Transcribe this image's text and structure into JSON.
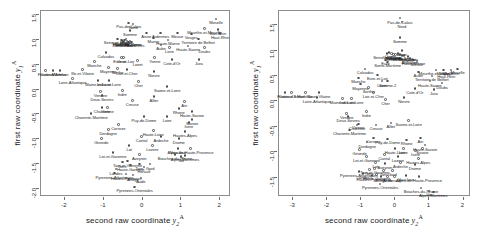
{
  "figure": {
    "type": "scatter-pair",
    "background": "#ffffff",
    "marker_color": "#4d4d4d",
    "axis_color": "#6e6e6e",
    "label_color": "#1f1f1f"
  },
  "chart_data": [
    {
      "type": "scatter",
      "panel": "left",
      "title": "",
      "xlabel": "second raw coordinate",
      "xlabel_var": "y",
      "xlabel_sub": "2",
      "xlabel_sup": "A",
      "ylabel": "first raw coordinate",
      "ylabel_var": "y",
      "ylabel_sub": "1",
      "ylabel_sup": "A",
      "xlim": [
        -2.62,
        2.28
      ],
      "ylim": [
        -2.16,
        1.58
      ],
      "xticks": [
        -2,
        -1,
        0,
        1,
        2
      ],
      "xticklabels": [
        "-2",
        "-1",
        "0",
        "1",
        "2"
      ],
      "yticks": [
        1.5,
        1.0,
        0.5,
        0.0,
        -0.5,
        -1.0,
        -1.5,
        -2.0
      ],
      "yticklabels": [
        "1.5",
        "1.0",
        "0.5",
        "0.0",
        "-0.5",
        "-1.0",
        "-1.5",
        "-2.0"
      ],
      "grid": false,
      "legend": "none",
      "points": [
        {
          "label": "Pas-de-Calais",
          "x": -0.33,
          "y": 1.32
        },
        {
          "label": "Nord",
          "x": -0.22,
          "y": 1.3
        },
        {
          "label": "Moselle",
          "x": 1.92,
          "y": 1.4
        },
        {
          "label": "Meurthe-et-Moselle",
          "x": 1.62,
          "y": 1.21
        },
        {
          "label": "Bas-Rhin",
          "x": 1.97,
          "y": 1.19
        },
        {
          "label": "Haut-Rhin",
          "x": 2.02,
          "y": 1.11
        },
        {
          "label": "Somme",
          "x": -0.3,
          "y": 1.17
        },
        {
          "label": "Aisne",
          "x": 0.12,
          "y": 1.12
        },
        {
          "label": "Ardennes",
          "x": 0.49,
          "y": 1.12
        },
        {
          "label": "Meuse",
          "x": 0.92,
          "y": 1.12
        },
        {
          "label": "Vosges",
          "x": 1.28,
          "y": 1.1
        },
        {
          "label": "Marne",
          "x": 0.3,
          "y": 1.02
        },
        {
          "label": "Haute-Marne",
          "x": 0.68,
          "y": 0.98
        },
        {
          "label": "Territoire de Belfort",
          "x": 1.46,
          "y": 1.0
        },
        {
          "label": "Seine-et-Marne",
          "x": -0.62,
          "y": 1.0
        },
        {
          "label": "Oise",
          "x": -0.4,
          "y": 1.0
        },
        {
          "label": "Val-d'Oise",
          "x": -0.52,
          "y": 0.98
        },
        {
          "label": "Yvelines",
          "x": -0.5,
          "y": 0.96
        },
        {
          "label": "Essonne",
          "x": -0.46,
          "y": 0.94
        },
        {
          "label": "Paris",
          "x": -0.44,
          "y": 0.98
        },
        {
          "label": "Hauts-de-Seine",
          "x": -0.38,
          "y": 0.96
        },
        {
          "label": "Seine-Saint-Denis",
          "x": -0.34,
          "y": 0.94
        },
        {
          "label": "Val-de-Marne",
          "x": -0.3,
          "y": 0.96
        },
        {
          "label": "Eure",
          "x": -0.26,
          "y": 0.94
        },
        {
          "label": "Aube",
          "x": 0.5,
          "y": 0.88
        },
        {
          "label": "Haute-Saone",
          "x": 1.2,
          "y": 0.86
        },
        {
          "label": "Doubs",
          "x": 1.62,
          "y": 0.82
        },
        {
          "label": "Jura",
          "x": 1.48,
          "y": 0.58
        },
        {
          "label": "Loire",
          "x": 0.72,
          "y": 0.82
        },
        {
          "label": "Calvados",
          "x": -0.92,
          "y": 0.72
        },
        {
          "label": "Orne",
          "x": -0.52,
          "y": 0.62
        },
        {
          "label": "Eure-et-Loir",
          "x": -0.46,
          "y": 0.62
        },
        {
          "label": "Yonne",
          "x": 0.34,
          "y": 0.62
        },
        {
          "label": "Cote-d'Or",
          "x": 0.78,
          "y": 0.58
        },
        {
          "label": "Manche",
          "x": -1.22,
          "y": 0.54
        },
        {
          "label": "Loiret",
          "x": -0.1,
          "y": 0.56
        },
        {
          "label": "Mayenne",
          "x": -0.86,
          "y": 0.42
        },
        {
          "label": "Sarthe",
          "x": -0.62,
          "y": 0.4
        },
        {
          "label": "Loir-et-Cher",
          "x": -0.38,
          "y": 0.38
        },
        {
          "label": "Nievre",
          "x": 0.32,
          "y": 0.34
        },
        {
          "label": "Ille-et-Vilaine",
          "x": -1.52,
          "y": 0.38
        },
        {
          "label": "Cotes-d'Armor",
          "x": -2.28,
          "y": 0.36
        },
        {
          "label": "Finistere",
          "x": -2.48,
          "y": 0.36
        },
        {
          "label": "Morbihan",
          "x": -2.1,
          "y": 0.36
        },
        {
          "label": "Loire-Atlantique",
          "x": -1.78,
          "y": 0.2
        },
        {
          "label": "Maine-et-Loire",
          "x": -1.12,
          "y": 0.16
        },
        {
          "label": "Indre-et-Loire",
          "x": -0.84,
          "y": 0.16
        },
        {
          "label": "Cher",
          "x": -0.08,
          "y": 0.14
        },
        {
          "label": "Saone-et-Loire",
          "x": 0.66,
          "y": 0.04
        },
        {
          "label": "Vendee",
          "x": -1.06,
          "y": -0.06
        },
        {
          "label": "Indre",
          "x": -0.5,
          "y": -0.04
        },
        {
          "label": "Deux-Sevres",
          "x": -1.02,
          "y": -0.14
        },
        {
          "label": "Allier",
          "x": 0.32,
          "y": -0.16
        },
        {
          "label": "Creuse",
          "x": -0.24,
          "y": -0.24
        },
        {
          "label": "Ain",
          "x": 1.1,
          "y": -0.26
        },
        {
          "label": "Vienne",
          "x": -0.88,
          "y": -0.38
        },
        {
          "label": "Charente",
          "x": -1.02,
          "y": -0.38
        },
        {
          "label": "Rhone",
          "x": 0.96,
          "y": -0.4
        },
        {
          "label": "Haute-Savoie",
          "x": 1.3,
          "y": -0.46
        },
        {
          "label": "Charente-Maritime",
          "x": -1.3,
          "y": -0.5
        },
        {
          "label": "Puy-de-Dome",
          "x": 0.06,
          "y": -0.56
        },
        {
          "label": "Loire",
          "x": 0.66,
          "y": -0.56
        },
        {
          "label": "Savoie",
          "x": 1.3,
          "y": -0.62
        },
        {
          "label": "Isere",
          "x": 1.22,
          "y": -0.68
        },
        {
          "label": "Correze",
          "x": -0.6,
          "y": -0.72
        },
        {
          "label": "Dordogne",
          "x": -0.86,
          "y": -0.82
        },
        {
          "label": "Haute-Loire",
          "x": 0.3,
          "y": -0.84
        },
        {
          "label": "Hautes-Alpes",
          "x": 1.12,
          "y": -0.86
        },
        {
          "label": "Gironde",
          "x": -1.04,
          "y": -1.0
        },
        {
          "label": "Cantal",
          "x": 0.0,
          "y": -0.96
        },
        {
          "label": "Ardeche",
          "x": 0.5,
          "y": -0.96
        },
        {
          "label": "Drome",
          "x": 0.96,
          "y": -1.0
        },
        {
          "label": "Lot",
          "x": -0.32,
          "y": -1.14
        },
        {
          "label": "Lozere",
          "x": 0.28,
          "y": -1.14
        },
        {
          "label": "Vaucluse",
          "x": 0.94,
          "y": -1.2
        },
        {
          "label": "Alpes-de-Haute-Provence",
          "x": 1.26,
          "y": -1.2
        },
        {
          "label": "Lot-et-Garonne",
          "x": -0.74,
          "y": -1.28
        },
        {
          "label": "Aveyron",
          "x": -0.06,
          "y": -1.32
        },
        {
          "label": "Bouches-du-Rhone",
          "x": 0.86,
          "y": -1.32
        },
        {
          "label": "Alpes-Maritimes",
          "x": 1.12,
          "y": -1.34
        },
        {
          "label": "Var",
          "x": 1.02,
          "y": -1.36
        },
        {
          "label": "Gers",
          "x": -0.5,
          "y": -1.48
        },
        {
          "label": "Tarn-et-Garonne",
          "x": -0.36,
          "y": -1.46
        },
        {
          "label": "Haute-Garonne",
          "x": -0.28,
          "y": -1.54
        },
        {
          "label": "Tarn",
          "x": -0.06,
          "y": -1.52
        },
        {
          "label": "Gard",
          "x": 0.22,
          "y": -1.52
        },
        {
          "label": "Herault",
          "x": 0.06,
          "y": -1.58
        },
        {
          "label": "Landes",
          "x": -0.66,
          "y": -1.62
        },
        {
          "label": "Pyrenees-Atlantiques",
          "x": -0.7,
          "y": -1.7
        },
        {
          "label": "Hautes-Pyrenees",
          "x": -0.4,
          "y": -1.72
        },
        {
          "label": "Ariege",
          "x": -0.22,
          "y": -1.74
        },
        {
          "label": "Aude",
          "x": -0.02,
          "y": -1.8
        },
        {
          "label": "Pyrenees-Orientales",
          "x": -0.18,
          "y": -1.98
        }
      ]
    },
    {
      "type": "scatter",
      "panel": "right",
      "title": "",
      "xlabel": "second raw coordinate",
      "xlabel_var": "y",
      "xlabel_sub": "2",
      "xlabel_sup": "A",
      "ylabel": "first raw coordinate",
      "ylabel_var": "y",
      "ylabel_sub": "1",
      "ylabel_sup": "A",
      "xlim": [
        -3.42,
        2.22
      ],
      "ylim": [
        -1.88,
        1.78
      ],
      "xticks": [
        -3,
        -2,
        -1,
        0,
        1,
        2
      ],
      "xticklabels": [
        "-3",
        "-2",
        "-1",
        "0",
        "1",
        "2"
      ],
      "yticks": [
        1.5,
        1.0,
        0.5,
        0.0,
        -0.5,
        -1.0,
        -1.5
      ],
      "yticklabels": [
        "1.5",
        "1.0",
        "0.5",
        "0.0",
        "-0.5",
        "-1.0",
        "-1.5"
      ],
      "grid": false,
      "legend": "none",
      "points": [
        {
          "label": "Pas-de-Calais",
          "x": 0.16,
          "y": 1.62
        },
        {
          "label": "Nord",
          "x": 0.22,
          "y": 1.54
        },
        {
          "label": "Somme",
          "x": 0.16,
          "y": 1.24
        },
        {
          "label": "Aisne",
          "x": 0.22,
          "y": 0.98
        },
        {
          "label": "Oise",
          "x": -0.16,
          "y": 0.94
        },
        {
          "label": "Seine-et-Marne",
          "x": -0.22,
          "y": 0.92
        },
        {
          "label": "Val-d'Oise",
          "x": -0.08,
          "y": 0.92
        },
        {
          "label": "Yvelines",
          "x": -0.02,
          "y": 0.9
        },
        {
          "label": "Essonne",
          "x": 0.04,
          "y": 0.9
        },
        {
          "label": "Paris",
          "x": 0.1,
          "y": 0.92
        },
        {
          "label": "Hauts-de-Seine",
          "x": 0.16,
          "y": 0.9
        },
        {
          "label": "Seine-Saint-Denis",
          "x": 0.22,
          "y": 0.88
        },
        {
          "label": "Val-de-Marne",
          "x": 0.28,
          "y": 0.88
        },
        {
          "label": "Marne",
          "x": 0.4,
          "y": 0.86
        },
        {
          "label": "Ardennes",
          "x": 0.46,
          "y": 0.82
        },
        {
          "label": "Haute-Marne",
          "x": 0.56,
          "y": 0.8
        },
        {
          "label": "Eure",
          "x": -0.26,
          "y": 0.8
        },
        {
          "label": "Meuse",
          "x": 0.66,
          "y": 0.78
        },
        {
          "label": "Seine-Maritime",
          "x": -0.2,
          "y": 0.76
        },
        {
          "label": "Moselle",
          "x": 1.86,
          "y": 0.62
        },
        {
          "label": "Meurthe-et-Moselle",
          "x": 1.22,
          "y": 0.6
        },
        {
          "label": "Vosges",
          "x": 1.44,
          "y": 0.6
        },
        {
          "label": "Bas-Rhin",
          "x": 1.66,
          "y": 0.6
        },
        {
          "label": "Haut-Rhin",
          "x": 1.52,
          "y": 0.54
        },
        {
          "label": "Calvados",
          "x": -0.86,
          "y": 0.62
        },
        {
          "label": "Aube",
          "x": 0.7,
          "y": 0.56
        },
        {
          "label": "Territoire de Belfort",
          "x": 1.1,
          "y": 0.48
        },
        {
          "label": "Eure-et-Loir",
          "x": -0.5,
          "y": 0.5
        },
        {
          "label": "Manche",
          "x": -1.06,
          "y": 0.44
        },
        {
          "label": "Loiret",
          "x": -0.36,
          "y": 0.38
        },
        {
          "label": "Somme-2",
          "x": -0.2,
          "y": 0.38
        },
        {
          "label": "Haute-Saone",
          "x": 1.04,
          "y": 0.38
        },
        {
          "label": "Doubs",
          "x": 1.4,
          "y": 0.34
        },
        {
          "label": "Mayenne",
          "x": -1.0,
          "y": 0.32
        },
        {
          "label": "Sarthe",
          "x": -0.76,
          "y": 0.26
        },
        {
          "label": "Cote-d'Or",
          "x": 0.6,
          "y": 0.24
        },
        {
          "label": "Jura",
          "x": 1.16,
          "y": 0.22
        },
        {
          "label": "Cotes-d'Armor",
          "x": -3.02,
          "y": 0.16
        },
        {
          "label": "Finistere",
          "x": -3.22,
          "y": 0.16
        },
        {
          "label": "Morbihan",
          "x": -2.62,
          "y": 0.16
        },
        {
          "label": "Ille-et-Vilaine",
          "x": -2.22,
          "y": 0.16
        },
        {
          "label": "Loir-et-Cher",
          "x": -0.62,
          "y": 0.16
        },
        {
          "label": "Loire-Atlantique",
          "x": -2.28,
          "y": 0.06
        },
        {
          "label": "Maine-et-Loire",
          "x": -1.52,
          "y": 0.04
        },
        {
          "label": "Indre-et-Loire",
          "x": -1.26,
          "y": 0.04
        },
        {
          "label": "Nievre",
          "x": 0.28,
          "y": 0.06
        },
        {
          "label": "Cher",
          "x": -0.26,
          "y": 0.02
        },
        {
          "label": "Vendee",
          "x": -1.4,
          "y": -0.26
        },
        {
          "label": "Indre",
          "x": -0.82,
          "y": -0.22
        },
        {
          "label": "Deux-Sevres",
          "x": -1.36,
          "y": -0.32
        },
        {
          "label": "Saone-et-Loire",
          "x": 0.42,
          "y": -0.4
        },
        {
          "label": "Vienne",
          "x": -1.06,
          "y": -0.46
        },
        {
          "label": "Charente",
          "x": -1.1,
          "y": -0.48
        },
        {
          "label": "Allier",
          "x": -0.1,
          "y": -0.44
        },
        {
          "label": "Creuse",
          "x": -0.54,
          "y": -0.48
        },
        {
          "label": "Charente-Maritime",
          "x": -1.32,
          "y": -0.58
        },
        {
          "label": "Correze",
          "x": -0.62,
          "y": -0.74
        },
        {
          "label": "Puy-de-Dome",
          "x": -0.2,
          "y": -0.76
        },
        {
          "label": "Rhone",
          "x": 0.36,
          "y": -0.78
        },
        {
          "label": "Ain",
          "x": 0.76,
          "y": -0.74
        },
        {
          "label": "Dordogne",
          "x": -0.8,
          "y": -0.82
        },
        {
          "label": "Haute-Savoie",
          "x": 0.9,
          "y": -0.88
        },
        {
          "label": "Gironde",
          "x": -1.02,
          "y": -0.96
        },
        {
          "label": "Haute-Loire",
          "x": 0.02,
          "y": -0.94
        },
        {
          "label": "Loire",
          "x": 0.26,
          "y": -0.94
        },
        {
          "label": "Savoie",
          "x": 0.82,
          "y": -0.94
        },
        {
          "label": "Isere",
          "x": 0.62,
          "y": -0.98
        },
        {
          "label": "Lot-et-Garonne",
          "x": -0.82,
          "y": -1.1
        },
        {
          "label": "Cantal",
          "x": -0.3,
          "y": -1.06
        },
        {
          "label": "Lozere",
          "x": 0.1,
          "y": -1.1
        },
        {
          "label": "Hautes-Alpes",
          "x": 0.7,
          "y": -1.14
        },
        {
          "label": "Lot",
          "x": -0.56,
          "y": -1.22
        },
        {
          "label": "Aveyron",
          "x": -0.28,
          "y": -1.24
        },
        {
          "label": "Ardeche",
          "x": 0.18,
          "y": -1.22
        },
        {
          "label": "Drome",
          "x": 0.6,
          "y": -1.26
        },
        {
          "label": "Tarn-et-Garonne",
          "x": -0.58,
          "y": -1.34
        },
        {
          "label": "Gers",
          "x": -0.74,
          "y": -1.36
        },
        {
          "label": "Tarn",
          "x": -0.32,
          "y": -1.38
        },
        {
          "label": "Gard",
          "x": -0.06,
          "y": -1.38
        },
        {
          "label": "Pyrenees-Atlantiques",
          "x": -1.04,
          "y": -1.4
        },
        {
          "label": "Landes",
          "x": -0.92,
          "y": -1.44
        },
        {
          "label": "Haute-Garonne",
          "x": -0.52,
          "y": -1.46
        },
        {
          "label": "Hautes-Pyrenees",
          "x": -0.66,
          "y": -1.48
        },
        {
          "label": "Ariege",
          "x": -0.4,
          "y": -1.5
        },
        {
          "label": "Aude",
          "x": -0.2,
          "y": -1.5
        },
        {
          "label": "Herault",
          "x": 0.0,
          "y": -1.5
        },
        {
          "label": "Vaucluse",
          "x": 0.34,
          "y": -1.48
        },
        {
          "label": "Alpes-de-Haute-Provence",
          "x": 0.72,
          "y": -1.5
        },
        {
          "label": "Pyrenees-Orientales",
          "x": -0.42,
          "y": -1.64
        },
        {
          "label": "Bouches-du-Rhone",
          "x": 0.78,
          "y": -1.72
        },
        {
          "label": "Var",
          "x": 1.02,
          "y": -1.78
        },
        {
          "label": "Alpes-Maritimes",
          "x": 1.14,
          "y": -1.8
        }
      ]
    }
  ]
}
